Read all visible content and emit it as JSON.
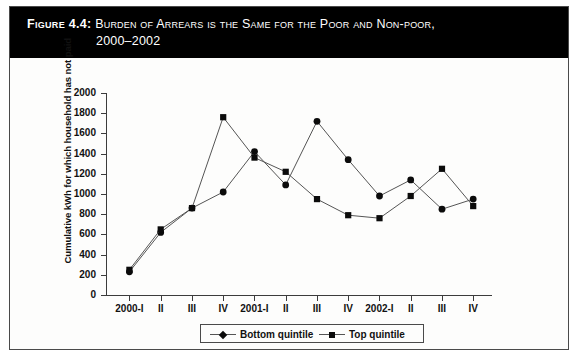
{
  "figure": {
    "label": "Figure 4.4:",
    "title_line_1": "Burden of Arrears is the Same for the Poor and Non-poor,",
    "title_line_2": "2000–2002"
  },
  "legend": {
    "position": "bottom-center",
    "entries": [
      {
        "label": "Bottom quintile",
        "marker": "diamond-marker-icon"
      },
      {
        "label": "Top quintile",
        "marker": "square-marker-icon"
      }
    ]
  },
  "colors": {
    "band_background": "#000000",
    "band_text": "#ffffff",
    "plot_background": "#fdfdfc",
    "axis": "#3c3c3c",
    "series_line": "#555555",
    "marker": "#0b0b0b",
    "frame_border": "#4a4a4a"
  },
  "chart_data": {
    "type": "line",
    "title": "Burden of Arrears is the Same for the Poor and Non-poor, 2000–2002",
    "xlabel": "",
    "ylabel": "Cumulative kWh for which household has not paid",
    "categories": [
      "2000-I",
      "II",
      "III",
      "IV",
      "2001-I",
      "II",
      "III",
      "IV",
      "2002-I",
      "II",
      "III",
      "IV"
    ],
    "ylim": [
      0,
      2000
    ],
    "yticks": [
      0,
      200,
      400,
      600,
      800,
      1000,
      1200,
      1400,
      1600,
      1800,
      2000
    ],
    "ytick_labels": [
      "0",
      "200",
      "400",
      "600",
      "800",
      "1000",
      "1200",
      "1400",
      "1600",
      "1800",
      "2000"
    ],
    "grid": false,
    "legend_position": "bottom",
    "series": [
      {
        "name": "Bottom quintile",
        "marker": "diamond",
        "values": [
          230,
          620,
          860,
          1020,
          1420,
          1090,
          1720,
          1340,
          980,
          1140,
          850,
          950
        ]
      },
      {
        "name": "Top quintile",
        "marker": "square",
        "values": [
          250,
          650,
          860,
          1760,
          1360,
          1220,
          950,
          790,
          760,
          980,
          1250,
          880
        ]
      }
    ]
  }
}
